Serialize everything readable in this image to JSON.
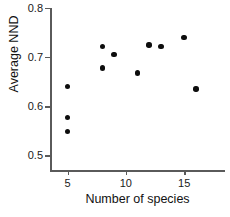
{
  "chart_data": {
    "type": "scatter",
    "title": "",
    "xlabel": "Number of species",
    "ylabel": "Average NND",
    "xlim": [
      3.5,
      18.5
    ],
    "ylim": [
      0.47,
      0.8
    ],
    "xticks": [
      5,
      10,
      15
    ],
    "xtick_labels": [
      "5",
      "10",
      "15"
    ],
    "yticks": [
      0.5,
      0.6,
      0.7,
      0.8
    ],
    "ytick_labels": [
      "0.5",
      "0.6",
      "0.7",
      "0.8"
    ],
    "grid": false,
    "legend": false,
    "marker": "filled-circle",
    "marker_color": "#0d0d0d",
    "axis_color": "#5a5a5a",
    "background": "#ffffff",
    "points": [
      {
        "x": 5,
        "y": 0.64
      },
      {
        "x": 5,
        "y": 0.577
      },
      {
        "x": 5,
        "y": 0.548
      },
      {
        "x": 8,
        "y": 0.722
      },
      {
        "x": 8,
        "y": 0.678
      },
      {
        "x": 9,
        "y": 0.705
      },
      {
        "x": 11,
        "y": 0.668
      },
      {
        "x": 12,
        "y": 0.725
      },
      {
        "x": 13,
        "y": 0.721
      },
      {
        "x": 15,
        "y": 0.74
      },
      {
        "x": 16,
        "y": 0.635
      }
    ]
  }
}
